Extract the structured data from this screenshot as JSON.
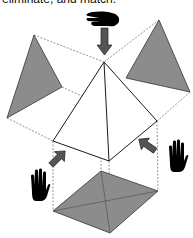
{
  "caption": "eliminate, and match.",
  "colors": {
    "face_fill": "#8c8c8c",
    "stroke": "#1a1a1a",
    "dashed": "#777777",
    "arrow_fill": "#555555",
    "hand_fill": "#000000",
    "pyramid_fill": "#ffffff"
  },
  "figure": {
    "pyramid": {
      "apex": [
        104,
        62
      ],
      "base_left": [
        53,
        141
      ],
      "base_front": [
        109,
        161
      ],
      "base_right": [
        157,
        121
      ]
    },
    "left_projection": [
      [
        34,
        35
      ],
      [
        62,
        87
      ],
      [
        7,
        118
      ]
    ],
    "right_projection": [
      [
        159,
        20
      ],
      [
        126,
        78
      ],
      [
        190,
        92
      ]
    ],
    "bottom_projection": [
      [
        101,
        171
      ],
      [
        158,
        191
      ],
      [
        110,
        233
      ],
      [
        53,
        211
      ]
    ],
    "hands": [
      "top-hand-pointing",
      "left-hand-raised",
      "right-hand-raised"
    ],
    "arrows": [
      "down-arrow",
      "up-right-arrow",
      "up-left-arrow"
    ]
  }
}
